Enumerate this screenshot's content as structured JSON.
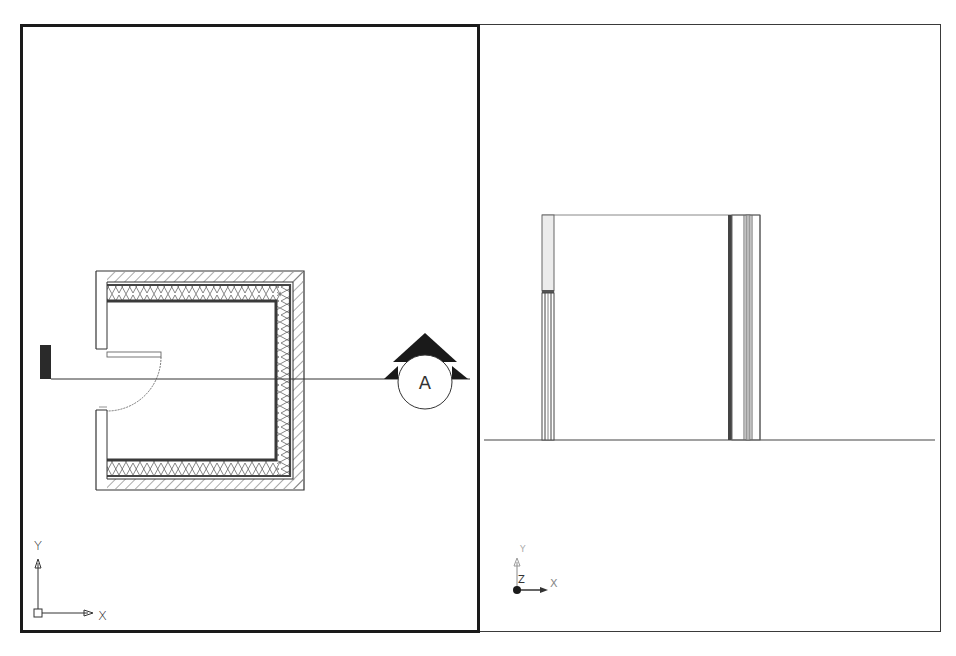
{
  "app": {
    "type": "CAD drawing workspace",
    "viewport_layout": "two tiled viewports"
  },
  "viewports": [
    {
      "id": "left",
      "view": "Plan (Top)",
      "active": true,
      "border_color": "#1a1a1a",
      "ucs_icon": {
        "x_label": "X",
        "y_label": "Y",
        "style": "2D"
      },
      "content": {
        "description": "Floor plan of a U-shaped room with layered wall (hatched cladding, insulation crosshatch) and a swinging door opening on the left side",
        "section_marker": {
          "label": "A"
        }
      }
    },
    {
      "id": "right",
      "view": "Elevation / Section A",
      "active": false,
      "border_color": "#3a3a3a",
      "ucs_icon": {
        "x_label": "X",
        "y_label": "Y",
        "z_label": "Z",
        "style": "3D"
      },
      "content": {
        "description": "Section elevation showing door jamb at left, layered wall at right, and ground line"
      }
    }
  ],
  "colors": {
    "line": "#333333",
    "heavy_line": "#1a1a1a",
    "hatch": "#555555",
    "jamb_fill": "#e8e8e8",
    "background": "#ffffff"
  }
}
